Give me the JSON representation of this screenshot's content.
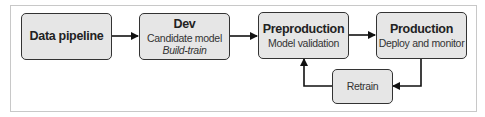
{
  "diagram": {
    "nodes": [
      {
        "id": "data-pipeline",
        "title": "Data pipeline"
      },
      {
        "id": "dev",
        "title": "Dev",
        "subtitle": "Candidate model",
        "note": "Build-train"
      },
      {
        "id": "preproduction",
        "title": "Preproduction",
        "subtitle": "Model validation"
      },
      {
        "id": "production",
        "title": "Production",
        "subtitle": "Deploy and monitor"
      },
      {
        "id": "retrain",
        "subtitle": "Retrain"
      }
    ],
    "edges": [
      {
        "from": "data-pipeline",
        "to": "dev"
      },
      {
        "from": "dev",
        "to": "preproduction"
      },
      {
        "from": "preproduction",
        "to": "production"
      },
      {
        "from": "production",
        "to": "retrain"
      },
      {
        "from": "retrain",
        "to": "preproduction"
      }
    ],
    "colors": {
      "box_fill": "#e6e6e6",
      "stroke": "#222222"
    }
  }
}
